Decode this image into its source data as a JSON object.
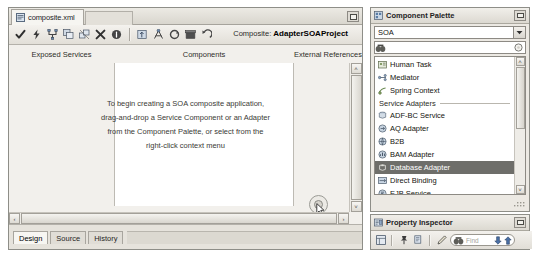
{
  "editor": {
    "document_tab": {
      "label": "composite.xml",
      "icon": "xml-file-icon"
    },
    "tabstrip_menu_icon": "tab-list-dropdown-icon",
    "toolbar": {
      "buttons": [
        {
          "name": "validate-button",
          "icon": "checkmark-icon",
          "tooltip": "Validate"
        },
        {
          "name": "build-button",
          "icon": "lightning-bolt-icon",
          "tooltip": "Build"
        },
        {
          "name": "topology-button",
          "icon": "branch-icon",
          "tooltip": "Topology"
        },
        {
          "name": "copy-component-button",
          "icon": "duplicate-icon",
          "tooltip": "Duplicate"
        },
        {
          "name": "unlink-button",
          "icon": "unlink-icon",
          "tooltip": "Unlink"
        },
        {
          "name": "delete-button",
          "icon": "delete-x-icon",
          "tooltip": "Delete"
        },
        {
          "name": "info-button",
          "icon": "info-circle-icon",
          "tooltip": "Info"
        },
        {
          "name": "separator-1",
          "icon": "toolbar-separator"
        },
        {
          "name": "deploy-button",
          "icon": "deploy-box-icon",
          "tooltip": "Deploy"
        },
        {
          "name": "test-button",
          "icon": "test-connections-icon",
          "tooltip": "Test"
        },
        {
          "name": "refresh-button",
          "icon": "refresh-circle-icon",
          "tooltip": "Refresh"
        },
        {
          "name": "package-button",
          "icon": "package-icon",
          "tooltip": "Package"
        },
        {
          "name": "undo-button",
          "icon": "undo-arrow-icon",
          "tooltip": "Undo"
        }
      ]
    },
    "composite_prefix": "Composite:",
    "composite_name": "AdapterSOAProject",
    "columns": {
      "exposed_services": "Exposed Services",
      "components": "Components",
      "external_references": "External References"
    },
    "hint_lines": [
      "To begin creating a SOA composite application,",
      "drag-and-drop a Service Component or an Adapter",
      "from the Component Palette, or select from the",
      "right-click context menu"
    ],
    "drop_target": {
      "name": "external-reference-drop-target",
      "cursor_icon": "drag-cursor-icon",
      "add_badge": "+",
      "arrow_icon": "drag-source-arrow-icon"
    },
    "view_tabs": [
      {
        "label": "Design",
        "active": true
      },
      {
        "label": "Source",
        "active": false
      },
      {
        "label": "History",
        "active": false
      }
    ],
    "scroll": {
      "left_arrow": "‹",
      "right_arrow": "›",
      "up_arrow": "˄",
      "down_arrow": "˅"
    }
  },
  "palette": {
    "title": "Component Palette",
    "title_icon": "palette-window-icon",
    "minimize_icon": "minimize-icon",
    "selector": {
      "value": "SOA",
      "arrow_icon": "chevron-down-icon"
    },
    "search": {
      "value": "",
      "placeholder": "",
      "icon": "palette-search-icon",
      "go_icon": "search-go-icon"
    },
    "items": [
      {
        "label": "Human Task",
        "icon": "human-task-icon",
        "type": "item",
        "selected": false
      },
      {
        "label": "Mediator",
        "icon": "mediator-icon",
        "type": "item",
        "selected": false
      },
      {
        "label": "Spring Context",
        "icon": "spring-context-icon",
        "type": "item",
        "selected": false
      },
      {
        "label": "Service Adapters",
        "icon": "",
        "type": "separator",
        "selected": false
      },
      {
        "label": "ADF-BC Service",
        "icon": "adf-bc-service-icon",
        "type": "item",
        "selected": false
      },
      {
        "label": "AQ Adapter",
        "icon": "aq-adapter-icon",
        "type": "item",
        "selected": false
      },
      {
        "label": "B2B",
        "icon": "b2b-icon",
        "type": "item",
        "selected": false
      },
      {
        "label": "BAM Adapter",
        "icon": "bam-adapter-icon",
        "type": "item",
        "selected": false
      },
      {
        "label": "Database Adapter",
        "icon": "database-adapter-icon",
        "type": "item",
        "selected": true
      },
      {
        "label": "Direct Binding",
        "icon": "direct-binding-icon",
        "type": "item",
        "selected": false
      },
      {
        "label": "EJB Service",
        "icon": "ejb-service-icon",
        "type": "item",
        "selected": false
      }
    ]
  },
  "inspector": {
    "title": "Property Inspector",
    "title_icon": "property-inspector-icon",
    "minimize_icon": "minimize-icon",
    "buttons": [
      {
        "name": "show-categories-button",
        "icon": "categories-icon"
      },
      {
        "name": "pin-button",
        "icon": "pin-icon"
      },
      {
        "name": "copy-properties-button",
        "icon": "copy-page-icon"
      },
      {
        "name": "edit-button",
        "icon": "pencil-icon"
      }
    ],
    "find": {
      "placeholder": "Find",
      "icon": "find-binoculars-icon",
      "prev_icon": "find-down-arrow-icon",
      "next_icon": "find-up-arrow-icon"
    }
  },
  "colors": {
    "chrome": "#ece9e3",
    "selection": "#6e6e6a",
    "canvas": "#f2f0ec",
    "lane": "#ffffff",
    "border": "#8e8e88"
  }
}
